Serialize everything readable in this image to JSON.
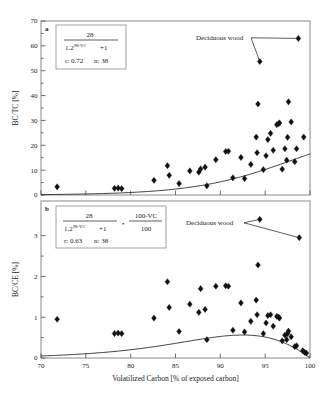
{
  "figure": {
    "background": "#ffffff",
    "marker_color": "#111111",
    "curve_color": "#2a2a2a",
    "frame_color": "#8a8a8a"
  },
  "chart_data": [
    {
      "type": "scatter",
      "panel_label": "a",
      "title": "",
      "xlabel": "Volatilized Carbon [% of exposed carbon]",
      "ylabel": "BC/TC [%]",
      "xlim": [
        70,
        100
      ],
      "ylim": [
        0,
        70
      ],
      "xticks": [
        70,
        75,
        80,
        85,
        90,
        95,
        100
      ],
      "xticklabels": [
        "70",
        "75",
        "80",
        "85",
        "90",
        "95",
        "100"
      ],
      "yticks": [
        0,
        10,
        20,
        30,
        40,
        50,
        60,
        70
      ],
      "yticklabels": [
        "0",
        "10",
        "20",
        "30",
        "40",
        "50",
        "60",
        "70"
      ],
      "grid": false,
      "legend": "none",
      "points": [
        [
          71.8,
          3.3
        ],
        [
          78.2,
          2.7
        ],
        [
          78.6,
          2.8
        ],
        [
          79.0,
          2.6
        ],
        [
          82.6,
          5.9
        ],
        [
          84.1,
          11.8
        ],
        [
          84.3,
          7.9
        ],
        [
          85.4,
          4.6
        ],
        [
          86.6,
          9.7
        ],
        [
          87.6,
          9.2
        ],
        [
          87.8,
          10.5
        ],
        [
          88.3,
          11.2
        ],
        [
          88.5,
          3.7
        ],
        [
          89.5,
          14.2
        ],
        [
          90.6,
          17.5
        ],
        [
          90.9,
          17.6
        ],
        [
          91.4,
          6.9
        ],
        [
          92.3,
          15.1
        ],
        [
          92.7,
          6.6
        ],
        [
          93.4,
          12.3
        ],
        [
          94.0,
          23.3
        ],
        [
          94.1,
          17.0
        ],
        [
          94.2,
          36.6
        ],
        [
          94.4,
          53.7
        ],
        [
          94.8,
          10.2
        ],
        [
          95.1,
          15.8
        ],
        [
          95.3,
          22.3
        ],
        [
          95.6,
          24.8
        ],
        [
          95.9,
          18.0
        ],
        [
          96.3,
          28.3
        ],
        [
          96.5,
          28.7
        ],
        [
          96.6,
          29.0
        ],
        [
          96.9,
          10.4
        ],
        [
          97.2,
          18.6
        ],
        [
          97.4,
          14.0
        ],
        [
          97.5,
          23.2
        ],
        [
          97.6,
          37.5
        ],
        [
          97.9,
          29.4
        ],
        [
          98.3,
          13.4
        ],
        [
          98.5,
          18.6
        ],
        [
          98.7,
          63.0
        ],
        [
          99.3,
          23.3
        ]
      ],
      "fit": {
        "expression_numerator": "28",
        "expression_base": "1.2",
        "expression_exponent": "98-VC",
        "expression_plus": "+1",
        "r_label": "r: 0.72",
        "n_label": "n: 38"
      },
      "annotations": [
        {
          "text": "Deciduous wood",
          "targets": [
            [
              98.7,
              63.0
            ],
            [
              94.4,
              53.7
            ]
          ]
        }
      ]
    },
    {
      "type": "scatter",
      "panel_label": "b",
      "title": "",
      "xlabel": "Volatilized Carbon [% of exposed carbon]",
      "ylabel": "BC/CE [%]",
      "xlim": [
        70,
        100
      ],
      "ylim": [
        0,
        3.85
      ],
      "xticks": [
        70,
        75,
        80,
        85,
        90,
        95,
        100
      ],
      "xticklabels": [
        "70",
        "75",
        "80",
        "85",
        "90",
        "95",
        "100"
      ],
      "yticks": [
        0,
        1,
        2,
        3
      ],
      "yticklabels": [
        "0",
        "1",
        "2",
        "3"
      ],
      "grid": false,
      "legend": "none",
      "points": [
        [
          71.8,
          0.95
        ],
        [
          78.2,
          0.6
        ],
        [
          78.6,
          0.61
        ],
        [
          79.0,
          0.6
        ],
        [
          82.6,
          0.98
        ],
        [
          84.1,
          1.87
        ],
        [
          84.3,
          1.24
        ],
        [
          85.4,
          0.65
        ],
        [
          86.6,
          1.32
        ],
        [
          87.6,
          1.12
        ],
        [
          87.8,
          1.7
        ],
        [
          88.3,
          1.19
        ],
        [
          88.5,
          0.45
        ],
        [
          89.5,
          1.76
        ],
        [
          90.6,
          1.77
        ],
        [
          90.9,
          1.76
        ],
        [
          91.4,
          0.68
        ],
        [
          92.3,
          1.35
        ],
        [
          92.7,
          0.64
        ],
        [
          93.4,
          0.9
        ],
        [
          94.0,
          1.42
        ],
        [
          94.1,
          1.06
        ],
        [
          94.2,
          2.28
        ],
        [
          94.4,
          3.4
        ],
        [
          94.8,
          0.6
        ],
        [
          95.1,
          0.86
        ],
        [
          95.3,
          1.04
        ],
        [
          95.6,
          1.06
        ],
        [
          95.9,
          0.78
        ],
        [
          96.3,
          1.02
        ],
        [
          96.5,
          1.0
        ],
        [
          96.6,
          0.98
        ],
        [
          96.9,
          0.42
        ],
        [
          97.2,
          0.56
        ],
        [
          97.4,
          0.45
        ],
        [
          97.5,
          0.6
        ],
        [
          97.6,
          0.66
        ],
        [
          97.9,
          0.52
        ],
        [
          98.3,
          0.28
        ],
        [
          98.5,
          0.3
        ],
        [
          98.8,
          2.95
        ],
        [
          99.2,
          0.18
        ],
        [
          99.4,
          0.14
        ],
        [
          99.6,
          0.12
        ]
      ],
      "fit": {
        "expression_numerator": "28",
        "expression_base": "1.2",
        "expression_exponent": "98-VC",
        "expression_plus": "+1",
        "expression_multiplier_numerator": "100-VC",
        "expression_multiplier_denominator": "100",
        "multiply_symbol": "•",
        "r_label": "r: 0.63",
        "n_label": "n: 38"
      },
      "annotations": [
        {
          "text": "Deciduous wood",
          "targets": [
            [
              94.4,
              3.4
            ],
            [
              98.8,
              2.95
            ]
          ]
        }
      ]
    }
  ]
}
